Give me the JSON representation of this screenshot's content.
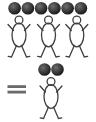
{
  "diagram": {
    "equation": {
      "left_figure_count": 3,
      "left_ball_count": 6,
      "operator": "=",
      "right_figure_count": 1,
      "right_ball_count": 2
    },
    "colors": {
      "background": "#ffffff",
      "outline": "#3f3f3f",
      "ball_highlight": "#6e6e6e",
      "ball_dark": "#1f1f1f",
      "equals": "#6a6a6a"
    },
    "stroke_width": 1.3,
    "scene": {
      "canvas": {
        "width": 96,
        "height": 122
      },
      "balls": [
        {
          "group": "left",
          "cx": 14.6,
          "cy": 8.2,
          "r": 6.3
        },
        {
          "group": "left",
          "cx": 27.9,
          "cy": 8.2,
          "r": 6.3
        },
        {
          "group": "left",
          "cx": 41.1,
          "cy": 8.2,
          "r": 6.3
        },
        {
          "group": "left",
          "cx": 54.4,
          "cy": 8.2,
          "r": 6.3
        },
        {
          "group": "left",
          "cx": 67.6,
          "cy": 8.2,
          "r": 6.3
        },
        {
          "group": "left",
          "cx": 80.9,
          "cy": 8.2,
          "r": 6.3
        },
        {
          "group": "right",
          "cx": 44.5,
          "cy": 69.5,
          "r": 6.3
        },
        {
          "group": "right",
          "cx": 57.5,
          "cy": 69.5,
          "r": 6.3
        }
      ],
      "figures": [
        {
          "group": "left",
          "cx": 19.0,
          "top": 16.0
        },
        {
          "group": "left",
          "cx": 48.5,
          "top": 16.0
        },
        {
          "group": "left",
          "cx": 76.8,
          "top": 16.0
        },
        {
          "group": "right",
          "cx": 51.0,
          "top": 77.5
        }
      ],
      "figure_geometry": {
        "head_r": 3.9,
        "head_dy": 4.0,
        "body_cy_dy": 19.0,
        "body_rx": 7.0,
        "body_ry": 11.8,
        "arm_inner_dx": 5.5,
        "arm_inner_dy": 14.5,
        "arm_outer_dx": 11.0,
        "arm_outer_dy": 8.5,
        "leg_inner_dx": 2.5,
        "leg_inner_dy": 29.5,
        "leg_outer_dx": 7.5,
        "leg_outer_dy": 41.0,
        "foot_dx": 10.8,
        "foot_dy": 40.3
      },
      "equals_sign": {
        "x": 7.5,
        "width": 18.5,
        "bar_height": 2.8,
        "bar1_y": 85.2,
        "bar2_y": 90.7
      }
    }
  }
}
